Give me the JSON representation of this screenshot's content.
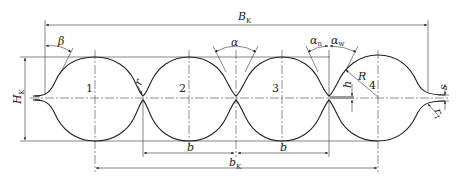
{
  "figure": {
    "type": "technical-drawing",
    "colors": {
      "line": "#222222",
      "background": "#ffffff"
    }
  },
  "labels": {
    "overall_width": {
      "main": "B",
      "sub": "K"
    },
    "overall_height": {
      "main": "H",
      "sub": "K"
    },
    "pitch_total": {
      "main": "b",
      "sub": "K"
    },
    "pitch_left": "b",
    "pitch_right": "b",
    "end_angle": "β",
    "flank_angle": "α",
    "inner_angle": {
      "main": "α",
      "sub": "n"
    },
    "outer_angle": {
      "main": "α",
      "sub": "w"
    },
    "crest_radius": "R",
    "root_radius": "r",
    "end_radius": {
      "main": "r",
      "sub": "1"
    },
    "depth": "h",
    "thickness": "s"
  },
  "convolutions": [
    "1",
    "2",
    "3",
    "4"
  ]
}
